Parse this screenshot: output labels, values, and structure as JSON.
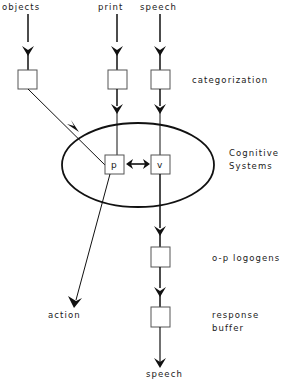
{
  "diagram": {
    "inputs": {
      "objects": "objects",
      "print": "print",
      "speech": "speech"
    },
    "stages": {
      "categorization": "categorization",
      "cognitive_line1": "Cognitive",
      "cognitive_line2": "Systems",
      "op_logogens": "o-p logogens",
      "response_line1": "response",
      "response_line2": "buffer"
    },
    "nodes": {
      "p": "p",
      "v": "v"
    },
    "outputs": {
      "action": "action",
      "speech": "speech"
    },
    "colors": {
      "line": "#111111",
      "box_stroke": "#555555",
      "background": "#ffffff"
    }
  }
}
